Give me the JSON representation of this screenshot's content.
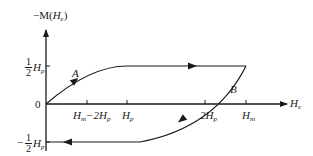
{
  "diagram": {
    "type": "hysteresis-loop",
    "y_axis": {
      "label_prefix": "−M",
      "label_open": "(",
      "label_var": "H",
      "label_sub": "e",
      "label_close": ")"
    },
    "x_axis": {
      "label_var": "H",
      "label_sub": "e"
    },
    "y_ticks": {
      "top": {
        "num": "1",
        "den": "2",
        "var": "H",
        "sub": "p"
      },
      "zero": "0",
      "bottom": {
        "sign": "−",
        "num": "1",
        "den": "2",
        "var": "H",
        "sub": "p"
      }
    },
    "x_ticks": [
      {
        "main": "H",
        "sub1": "m",
        "mid": "−2H",
        "sub2": "p"
      },
      {
        "main": "H",
        "sub1": "p"
      },
      {
        "main": "2H",
        "sub1": "p"
      },
      {
        "main": "H",
        "sub1": "m"
      }
    ],
    "curve_labels": {
      "A": "A",
      "B": "B"
    },
    "colors": {
      "stroke": "#1a1a1a",
      "background": "#ffffff"
    }
  }
}
